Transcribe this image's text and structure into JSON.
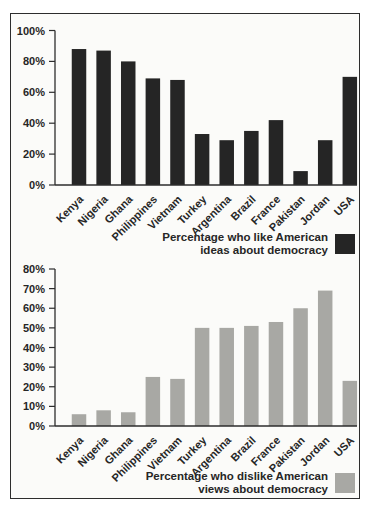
{
  "figure": {
    "background": "#ffffff",
    "frame_background": "#fbfbf9",
    "frame_border_color": "#2d2d2d",
    "axis_color": "#2d2d2d",
    "text_color": "#262626"
  },
  "chart_data": [
    {
      "type": "bar",
      "title": "",
      "xlabel": "",
      "ylabel": "",
      "categories": [
        "Kenya",
        "Nigeria",
        "Ghana",
        "Philippines",
        "Vietnam",
        "Turkey",
        "Argentina",
        "Brazil",
        "France",
        "Pakistan",
        "Jordan",
        "USA"
      ],
      "values": [
        88,
        87,
        80,
        69,
        68,
        33,
        29,
        35,
        42,
        9,
        29,
        70
      ],
      "ylim": [
        0,
        100
      ],
      "ytick_labels": [
        "0%",
        "20%",
        "40%",
        "60%",
        "80%",
        "100%"
      ],
      "grid": false,
      "bar_color": "#252525",
      "legend": {
        "line1": "Percentage who like American",
        "line2": "ideas about democracy",
        "swatch_color": "#252525",
        "position": "bottom-right"
      }
    },
    {
      "type": "bar",
      "title": "",
      "xlabel": "",
      "ylabel": "",
      "categories": [
        "Kenya",
        "Nigeria",
        "Ghana",
        "Philippines",
        "Vietnam",
        "Turkey",
        "Argentina",
        "Brazil",
        "France",
        "Pakistan",
        "Jordan",
        "USA"
      ],
      "values": [
        6,
        8,
        7,
        25,
        24,
        50,
        50,
        51,
        53,
        60,
        69,
        23
      ],
      "ylim": [
        0,
        80
      ],
      "ytick_labels": [
        "0%",
        "10%",
        "20%",
        "30%",
        "40%",
        "50%",
        "60%",
        "70%",
        "80%"
      ],
      "grid": false,
      "bar_color": "#a8a8a4",
      "legend": {
        "line1": "Percentage who dislike American",
        "line2": "views about democracy",
        "swatch_color": "#a8a8a4",
        "position": "bottom-right"
      }
    }
  ]
}
